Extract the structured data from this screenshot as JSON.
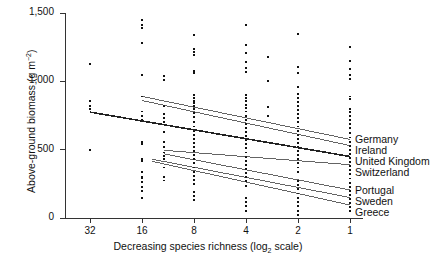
{
  "chart_data": {
    "type": "scatter",
    "title": "",
    "xlabel": "Decreasing species richness (log2 scale)",
    "ylabel": "Above-ground biomass (g m-2)",
    "xticks": [
      "32",
      "16",
      "8",
      "4",
      "2",
      "1"
    ],
    "xtick_values": [
      32,
      16,
      8,
      4,
      2,
      1
    ],
    "yticks": [
      "0",
      "500",
      "1,000",
      "1,500"
    ],
    "ytick_values": [
      0,
      500,
      1000,
      1500
    ],
    "ylim": [
      0,
      1500
    ],
    "grid": false,
    "legend_position": "right",
    "scatter_note": "Jittered points at each log2 richness level; values in g m-2",
    "points": [
      {
        "x": 32,
        "y": 1125
      },
      {
        "x": 32,
        "y": 860
      },
      {
        "x": 32,
        "y": 820
      },
      {
        "x": 32,
        "y": 795
      },
      {
        "x": 32,
        "y": 500
      },
      {
        "x": 16,
        "y": 1450
      },
      {
        "x": 16,
        "y": 1410
      },
      {
        "x": 16,
        "y": 1390
      },
      {
        "x": 16,
        "y": 1280
      },
      {
        "x": 16,
        "y": 1050
      },
      {
        "x": 16,
        "y": 890
      },
      {
        "x": 16,
        "y": 780
      },
      {
        "x": 16,
        "y": 745
      },
      {
        "x": 16,
        "y": 715
      },
      {
        "x": 16,
        "y": 560
      },
      {
        "x": 16,
        "y": 540
      },
      {
        "x": 16,
        "y": 430
      },
      {
        "x": 16,
        "y": 420
      },
      {
        "x": 16,
        "y": 340
      },
      {
        "x": 16,
        "y": 300
      },
      {
        "x": 16,
        "y": 290
      },
      {
        "x": 16,
        "y": 265
      },
      {
        "x": 16,
        "y": 230
      },
      {
        "x": 16,
        "y": 200
      },
      {
        "x": 16,
        "y": 150
      },
      {
        "x": 12,
        "y": 1040
      },
      {
        "x": 12,
        "y": 1010
      },
      {
        "x": 12,
        "y": 820
      },
      {
        "x": 12,
        "y": 760
      },
      {
        "x": 12,
        "y": 730
      },
      {
        "x": 12,
        "y": 700
      },
      {
        "x": 12,
        "y": 630
      },
      {
        "x": 12,
        "y": 560
      },
      {
        "x": 12,
        "y": 520
      },
      {
        "x": 12,
        "y": 480
      },
      {
        "x": 12,
        "y": 455
      },
      {
        "x": 12,
        "y": 430
      },
      {
        "x": 12,
        "y": 370
      },
      {
        "x": 12,
        "y": 300
      },
      {
        "x": 12,
        "y": 275
      },
      {
        "x": 8,
        "y": 1340
      },
      {
        "x": 8,
        "y": 1240
      },
      {
        "x": 8,
        "y": 1215
      },
      {
        "x": 8,
        "y": 1195
      },
      {
        "x": 8,
        "y": 1075
      },
      {
        "x": 8,
        "y": 1060
      },
      {
        "x": 8,
        "y": 900
      },
      {
        "x": 8,
        "y": 880
      },
      {
        "x": 8,
        "y": 860
      },
      {
        "x": 8,
        "y": 840
      },
      {
        "x": 8,
        "y": 820
      },
      {
        "x": 8,
        "y": 800
      },
      {
        "x": 8,
        "y": 770
      },
      {
        "x": 8,
        "y": 740
      },
      {
        "x": 8,
        "y": 700
      },
      {
        "x": 8,
        "y": 670
      },
      {
        "x": 8,
        "y": 640
      },
      {
        "x": 8,
        "y": 610
      },
      {
        "x": 8,
        "y": 580
      },
      {
        "x": 8,
        "y": 550
      },
      {
        "x": 8,
        "y": 520
      },
      {
        "x": 8,
        "y": 490
      },
      {
        "x": 8,
        "y": 460
      },
      {
        "x": 8,
        "y": 430
      },
      {
        "x": 8,
        "y": 400
      },
      {
        "x": 8,
        "y": 370
      },
      {
        "x": 8,
        "y": 340
      },
      {
        "x": 8,
        "y": 310
      },
      {
        "x": 8,
        "y": 280
      },
      {
        "x": 8,
        "y": 250
      },
      {
        "x": 8,
        "y": 190
      },
      {
        "x": 8,
        "y": 160
      },
      {
        "x": 8,
        "y": 130
      },
      {
        "x": 4,
        "y": 1415
      },
      {
        "x": 4,
        "y": 1265
      },
      {
        "x": 4,
        "y": 1205
      },
      {
        "x": 4,
        "y": 1140
      },
      {
        "x": 4,
        "y": 1100
      },
      {
        "x": 4,
        "y": 1070
      },
      {
        "x": 4,
        "y": 900
      },
      {
        "x": 4,
        "y": 880
      },
      {
        "x": 4,
        "y": 855
      },
      {
        "x": 4,
        "y": 830
      },
      {
        "x": 4,
        "y": 805
      },
      {
        "x": 4,
        "y": 780
      },
      {
        "x": 4,
        "y": 750
      },
      {
        "x": 4,
        "y": 720
      },
      {
        "x": 4,
        "y": 690
      },
      {
        "x": 4,
        "y": 660
      },
      {
        "x": 4,
        "y": 630
      },
      {
        "x": 4,
        "y": 600
      },
      {
        "x": 4,
        "y": 570
      },
      {
        "x": 4,
        "y": 540
      },
      {
        "x": 4,
        "y": 510
      },
      {
        "x": 4,
        "y": 480
      },
      {
        "x": 4,
        "y": 450
      },
      {
        "x": 4,
        "y": 420
      },
      {
        "x": 4,
        "y": 390
      },
      {
        "x": 4,
        "y": 360
      },
      {
        "x": 4,
        "y": 330
      },
      {
        "x": 4,
        "y": 300
      },
      {
        "x": 4,
        "y": 270
      },
      {
        "x": 4,
        "y": 235
      },
      {
        "x": 4,
        "y": 150
      },
      {
        "x": 4,
        "y": 120
      },
      {
        "x": 4,
        "y": 90
      },
      {
        "x": 4,
        "y": 55
      },
      {
        "x": 3,
        "y": 1180
      },
      {
        "x": 3,
        "y": 1005
      },
      {
        "x": 3,
        "y": 810
      },
      {
        "x": 3,
        "y": 745
      },
      {
        "x": 2,
        "y": 1345
      },
      {
        "x": 2,
        "y": 1105
      },
      {
        "x": 2,
        "y": 1060
      },
      {
        "x": 2,
        "y": 960
      },
      {
        "x": 2,
        "y": 910
      },
      {
        "x": 2,
        "y": 880
      },
      {
        "x": 2,
        "y": 850
      },
      {
        "x": 2,
        "y": 820
      },
      {
        "x": 2,
        "y": 790
      },
      {
        "x": 2,
        "y": 760
      },
      {
        "x": 2,
        "y": 730
      },
      {
        "x": 2,
        "y": 700
      },
      {
        "x": 2,
        "y": 670
      },
      {
        "x": 2,
        "y": 640
      },
      {
        "x": 2,
        "y": 610
      },
      {
        "x": 2,
        "y": 580
      },
      {
        "x": 2,
        "y": 550
      },
      {
        "x": 2,
        "y": 520
      },
      {
        "x": 2,
        "y": 490
      },
      {
        "x": 2,
        "y": 460
      },
      {
        "x": 2,
        "y": 430
      },
      {
        "x": 2,
        "y": 400
      },
      {
        "x": 2,
        "y": 370
      },
      {
        "x": 2,
        "y": 340
      },
      {
        "x": 2,
        "y": 270
      },
      {
        "x": 2,
        "y": 240
      },
      {
        "x": 2,
        "y": 210
      },
      {
        "x": 2,
        "y": 180
      },
      {
        "x": 2,
        "y": 150
      },
      {
        "x": 2,
        "y": 120
      },
      {
        "x": 2,
        "y": 90
      },
      {
        "x": 2,
        "y": 55
      },
      {
        "x": 2,
        "y": 25
      },
      {
        "x": 1,
        "y": 1250
      },
      {
        "x": 1,
        "y": 1150
      },
      {
        "x": 1,
        "y": 1090
      },
      {
        "x": 1,
        "y": 1050
      },
      {
        "x": 1,
        "y": 1015
      },
      {
        "x": 1,
        "y": 890
      },
      {
        "x": 1,
        "y": 870
      },
      {
        "x": 1,
        "y": 800
      },
      {
        "x": 1,
        "y": 775
      },
      {
        "x": 1,
        "y": 750
      },
      {
        "x": 1,
        "y": 720
      },
      {
        "x": 1,
        "y": 690
      },
      {
        "x": 1,
        "y": 660
      },
      {
        "x": 1,
        "y": 620
      },
      {
        "x": 1,
        "y": 590
      },
      {
        "x": 1,
        "y": 560
      },
      {
        "x": 1,
        "y": 530
      },
      {
        "x": 1,
        "y": 500
      },
      {
        "x": 1,
        "y": 470
      },
      {
        "x": 1,
        "y": 440
      },
      {
        "x": 1,
        "y": 410
      },
      {
        "x": 1,
        "y": 380
      },
      {
        "x": 1,
        "y": 350
      },
      {
        "x": 1,
        "y": 320
      },
      {
        "x": 1,
        "y": 290
      },
      {
        "x": 1,
        "y": 260
      },
      {
        "x": 1,
        "y": 230
      },
      {
        "x": 1,
        "y": 200
      },
      {
        "x": 1,
        "y": 170
      },
      {
        "x": 1,
        "y": 140
      },
      {
        "x": 1,
        "y": 110
      },
      {
        "x": 1,
        "y": 80
      },
      {
        "x": 1,
        "y": 50
      }
    ],
    "series": [
      {
        "name": "Germany",
        "type": "regression-line",
        "x_start": 16,
        "y_start": 890,
        "x_end": 1,
        "y_end": 575,
        "emphasis": "normal"
      },
      {
        "name": "Ireland",
        "type": "regression-line",
        "x_start": 16,
        "y_start": 860,
        "x_end": 1,
        "y_end": 530,
        "emphasis": "normal"
      },
      {
        "name": "United Kingdom",
        "type": "regression-line",
        "x_start": 32,
        "y_start": 775,
        "x_end": 1,
        "y_end": 450,
        "emphasis": "bold"
      },
      {
        "name": "Switzerland",
        "type": "regression-line",
        "x_start": 12,
        "y_start": 495,
        "x_end": 1,
        "y_end": 390,
        "emphasis": "normal"
      },
      {
        "name": "Portugal",
        "type": "regression-line",
        "x_start": 12,
        "y_start": 470,
        "x_end": 1,
        "y_end": 205,
        "emphasis": "normal"
      },
      {
        "name": "Sweden",
        "type": "regression-line",
        "x_start": 14,
        "y_start": 430,
        "x_end": 1,
        "y_end": 150,
        "emphasis": "normal"
      },
      {
        "name": "Greece",
        "type": "regression-line",
        "x_start": 14,
        "y_start": 415,
        "x_end": 1,
        "y_end": 95,
        "emphasis": "normal"
      }
    ],
    "legend_entries": [
      {
        "label": "Germany"
      },
      {
        "label": "Ireland"
      },
      {
        "label": "United Kingdom"
      },
      {
        "label": "Switzerland"
      },
      {
        "label": "Portugal"
      },
      {
        "label": "Sweden"
      },
      {
        "label": "Greece"
      }
    ],
    "colors": {
      "axis": "#333333",
      "point": "#111111",
      "line": "#222222",
      "background": "#ffffff"
    }
  },
  "axis": {
    "y_title_main": "Above-ground biomass (g m",
    "y_title_sup": "−2",
    "y_title_close": ")",
    "x_title_main": "Decreasing species richness (log",
    "x_title_sub": "2",
    "x_title_close": " scale)"
  }
}
